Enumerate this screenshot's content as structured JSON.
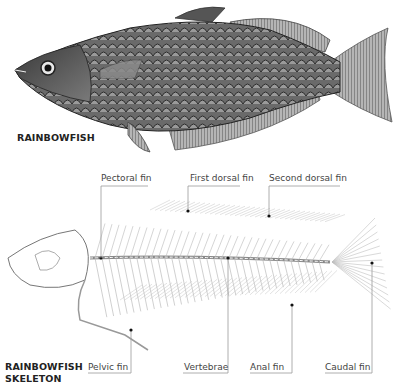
{
  "figure": {
    "top_illustration": {
      "title": "RAINBOWFISH",
      "subject": "rainbowfish-body-engraving"
    },
    "bottom_illustration": {
      "title_line1": "RAINBOWFISH",
      "title_line2": "SKELETON",
      "subject": "rainbowfish-skeleton-engraving"
    },
    "labels": {
      "top": [
        {
          "text": "Pectoral fin"
        },
        {
          "text": "First dorsal fin"
        },
        {
          "text": "Second dorsal fin"
        }
      ],
      "bottom": [
        {
          "text": "Pelvic fin"
        },
        {
          "text": "Vertebrae"
        },
        {
          "text": "Anal fin"
        },
        {
          "text": "Caudal fin"
        }
      ]
    },
    "colors": {
      "ink": "#222222",
      "label_text": "#444444",
      "leader_line": "#9a9a9a",
      "dot": "#111111",
      "background": "#ffffff"
    }
  }
}
